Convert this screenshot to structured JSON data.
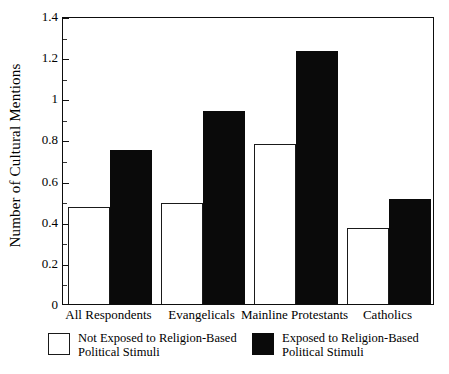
{
  "chart_data": {
    "type": "bar",
    "title": "",
    "xlabel": "",
    "ylabel": "Number of Cultural Mentions",
    "ylim": [
      0,
      1.4
    ],
    "ytick_labels": [
      "0",
      "0.2",
      "0.4",
      "0.6",
      "0.8",
      "1",
      "1.2",
      "1.4"
    ],
    "ytick_values": [
      0,
      0.2,
      0.4,
      0.6,
      0.8,
      1.0,
      1.2,
      1.4
    ],
    "yminor_values": [
      0.1,
      0.3,
      0.5,
      0.7,
      0.9,
      1.1,
      1.3
    ],
    "grid": false,
    "legend_position": "below-axes",
    "categories": [
      "All Respondents",
      "Evangelicals",
      "Mainline Protestants",
      "Catholics"
    ],
    "series": [
      {
        "name": "Not Exposed to Religion-Based Political Stimuli",
        "name_line1": "Not Exposed to Religion-Based",
        "name_line2": "Political Stimuli",
        "color": "#ffffff",
        "edge_color": "#1a1a1a",
        "values": [
          0.47,
          0.49,
          0.78,
          0.37
        ]
      },
      {
        "name": "Exposed to Religion-Based Political Stimuli",
        "name_line1": "Exposed to Religion-Based",
        "name_line2": "Political Stimuli",
        "color": "#0a0a0a",
        "edge_color": "#0a0a0a",
        "values": [
          0.75,
          0.94,
          1.23,
          0.51
        ]
      }
    ]
  }
}
